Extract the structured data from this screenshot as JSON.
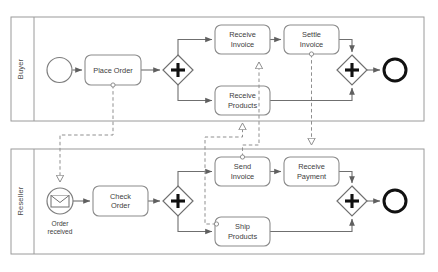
{
  "diagram": {
    "type": "bpmn-collaboration",
    "pools": [
      {
        "id": "buyer",
        "label": "Buyer",
        "x": 11,
        "y": 17,
        "w": 413,
        "h": 104,
        "header_w": 23,
        "elements": [
          {
            "id": "buyer-start",
            "kind": "start-event",
            "label": "",
            "cx": 59.5,
            "cy": 70,
            "r": 12.5
          },
          {
            "id": "place-order",
            "kind": "task",
            "label": "Place Order",
            "x": 85,
            "y": 55,
            "w": 56,
            "h": 30,
            "lines": [
              "Place Order"
            ]
          },
          {
            "id": "buyer-split",
            "kind": "parallel-gateway",
            "label": "",
            "cx": 178,
            "cy": 70,
            "r": 15
          },
          {
            "id": "receive-invoice",
            "kind": "task",
            "label": "Receive Invoice",
            "x": 215,
            "y": 25,
            "w": 55,
            "h": 29,
            "lines": [
              "Receive",
              "Invoice"
            ]
          },
          {
            "id": "settle-invoice",
            "kind": "task",
            "label": "Settle Invoice",
            "x": 284,
            "y": 25,
            "w": 55,
            "h": 29,
            "lines": [
              "Settle",
              "Invoice"
            ]
          },
          {
            "id": "receive-products",
            "kind": "task",
            "label": "Receive Products",
            "x": 215,
            "y": 86,
            "w": 55,
            "h": 29,
            "lines": [
              "Receive",
              "Products"
            ]
          },
          {
            "id": "buyer-join",
            "kind": "parallel-gateway",
            "label": "",
            "cx": 352,
            "cy": 70,
            "r": 15
          },
          {
            "id": "buyer-end",
            "kind": "end-event",
            "label": "",
            "cx": 395,
            "cy": 70,
            "r": 12
          }
        ]
      },
      {
        "id": "reseller",
        "label": "Reseller",
        "x": 11,
        "y": 149,
        "w": 413,
        "h": 105,
        "header_w": 23,
        "elements": [
          {
            "id": "order-received",
            "kind": "message-start-event",
            "label": "Order received",
            "cx": 60,
            "cy": 201,
            "r": 13,
            "lines": [
              "Order",
              "received"
            ]
          },
          {
            "id": "check-order",
            "kind": "task",
            "label": "Check Order",
            "x": 93,
            "y": 186,
            "w": 55,
            "h": 30,
            "lines": [
              "Check",
              "Order"
            ]
          },
          {
            "id": "reseller-split",
            "kind": "parallel-gateway",
            "label": "",
            "cx": 178,
            "cy": 201,
            "r": 15
          },
          {
            "id": "send-invoice",
            "kind": "task",
            "label": "Send Invoice",
            "x": 215,
            "y": 157,
            "w": 55,
            "h": 29,
            "lines": [
              "Send",
              "Invoice"
            ]
          },
          {
            "id": "receive-payment",
            "kind": "task",
            "label": "Receive Payment",
            "x": 284,
            "y": 157,
            "w": 55,
            "h": 29,
            "lines": [
              "Receive",
              "Payment"
            ]
          },
          {
            "id": "ship-products",
            "kind": "task",
            "label": "Ship Products",
            "x": 215,
            "y": 217,
            "w": 55,
            "h": 29,
            "lines": [
              "Ship",
              "Products"
            ]
          },
          {
            "id": "reseller-join",
            "kind": "parallel-gateway",
            "label": "",
            "cx": 352,
            "cy": 201,
            "r": 15
          },
          {
            "id": "reseller-end",
            "kind": "end-event",
            "label": "",
            "cx": 395,
            "cy": 201,
            "r": 12
          }
        ]
      }
    ],
    "sequence_flows": [
      {
        "id": "sf-buyer-1",
        "from": "buyer-start",
        "to": "place-order"
      },
      {
        "id": "sf-buyer-2",
        "from": "place-order",
        "to": "buyer-split"
      },
      {
        "id": "sf-buyer-3",
        "from": "buyer-split",
        "to": "receive-invoice"
      },
      {
        "id": "sf-buyer-4",
        "from": "buyer-split",
        "to": "receive-products"
      },
      {
        "id": "sf-buyer-5",
        "from": "receive-invoice",
        "to": "settle-invoice"
      },
      {
        "id": "sf-buyer-6",
        "from": "settle-invoice",
        "to": "buyer-join"
      },
      {
        "id": "sf-buyer-7",
        "from": "receive-products",
        "to": "buyer-join"
      },
      {
        "id": "sf-buyer-8",
        "from": "buyer-join",
        "to": "buyer-end"
      },
      {
        "id": "sf-res-1",
        "from": "order-received",
        "to": "check-order"
      },
      {
        "id": "sf-res-2",
        "from": "check-order",
        "to": "reseller-split"
      },
      {
        "id": "sf-res-3",
        "from": "reseller-split",
        "to": "send-invoice"
      },
      {
        "id": "sf-res-4",
        "from": "reseller-split",
        "to": "ship-products"
      },
      {
        "id": "sf-res-5",
        "from": "send-invoice",
        "to": "receive-payment"
      },
      {
        "id": "sf-res-6",
        "from": "receive-payment",
        "to": "reseller-join"
      },
      {
        "id": "sf-res-7",
        "from": "ship-products",
        "to": "reseller-join"
      },
      {
        "id": "sf-res-8",
        "from": "reseller-join",
        "to": "reseller-end"
      }
    ],
    "message_flows": [
      {
        "id": "mf-order",
        "from": "place-order",
        "to": "order-received"
      },
      {
        "id": "mf-invoice",
        "from": "send-invoice",
        "to": "receive-invoice"
      },
      {
        "id": "mf-products",
        "from": "ship-products",
        "to": "receive-products"
      },
      {
        "id": "mf-payment",
        "from": "settle-invoice",
        "to": "receive-payment"
      }
    ],
    "colors": {
      "pool_stroke": "#9a9a9a",
      "task_stroke": "#8c8c8c",
      "flow_stroke": "#6f6f6f",
      "message_stroke": "#8f8f8f",
      "end_event_stroke": "#111111",
      "text": "#3c3c3c",
      "background": "#ffffff"
    }
  }
}
